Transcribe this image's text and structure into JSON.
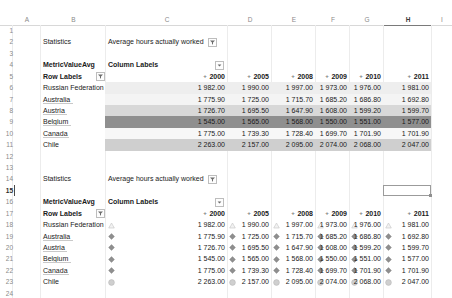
{
  "app": {
    "name": "spreadsheet",
    "active_cell": "H15",
    "active_column": "H",
    "active_row": "15"
  },
  "columns": [
    "A",
    "B",
    "C",
    "D",
    "E",
    "F",
    "G",
    "H",
    "I"
  ],
  "rows": [
    "1",
    "2",
    "3",
    "4",
    "5",
    "6",
    "7",
    "8",
    "9",
    "10",
    "11",
    "12",
    "13",
    "14",
    "15",
    "16",
    "17",
    "18",
    "19",
    "20",
    "21",
    "22",
    "23",
    "24"
  ],
  "icons": {
    "filter": "filter-icon",
    "dropdown": "chevron-down-icon",
    "expand": "+",
    "triangle": "triangle-up-icon",
    "diamond": "diamond-icon",
    "circle": "circle-icon"
  },
  "table1": {
    "row_index": 2,
    "statistics_label": "Statistics",
    "statistics_value": "Average hours actually worked",
    "metric_label": "MetricValueAvg",
    "column_labels": "Column Labels",
    "row_labels": "Row Labels",
    "years": [
      "2000",
      "2005",
      "2008",
      "2009",
      "2010",
      "2011"
    ],
    "rows": [
      {
        "name": "Russian Federation",
        "values": [
          "1 982.00",
          "1 990.00",
          "1 997.00",
          "1 973.00",
          "1 976.00",
          "1 981.00"
        ]
      },
      {
        "name": "Australia",
        "values": [
          "1 775.90",
          "1 725.00",
          "1 715.70",
          "1 685.20",
          "1 686.80",
          "1 692.80"
        ]
      },
      {
        "name": "Austria",
        "values": [
          "1 726.70",
          "1 695.50",
          "1 647.90",
          "1 608.00",
          "1 599.20",
          "1 599.70"
        ]
      },
      {
        "name": "Belgium",
        "values": [
          "1 545.00",
          "1 565.00",
          "1 568.00",
          "1 550.00",
          "1 551.00",
          "1 577.00"
        ]
      },
      {
        "name": "Canada",
        "values": [
          "1 775.00",
          "1 739.30",
          "1 728.40",
          "1 699.70",
          "1 701.90",
          "1 701.90"
        ]
      },
      {
        "name": "Chile",
        "values": [
          "2 263.00",
          "2 157.00",
          "2 095.00",
          "2 074.00",
          "2 068.00",
          "2 047.00"
        ]
      }
    ]
  },
  "table2": {
    "statistics_label": "Statistics",
    "statistics_value": "Average hours actually worked",
    "metric_label": "MetricValueAvg",
    "column_labels": "Column Labels",
    "row_labels": "Row Labels",
    "years": [
      "2000",
      "2005",
      "2008",
      "2009",
      "2010",
      "2011"
    ],
    "rows": [
      {
        "name": "Russian Federation",
        "icon": "triangle",
        "values": [
          "1 982.00",
          "1 990.00",
          "1 997.00",
          "1 973.00",
          "1 976.00",
          "1 981.00"
        ]
      },
      {
        "name": "Australia",
        "icon": "diamond",
        "values": [
          "1 775.90",
          "1 725.00",
          "1 715.70",
          "1 685.20",
          "1 686.80",
          "1 692.80"
        ]
      },
      {
        "name": "Austria",
        "icon": "diamond",
        "values": [
          "1 726.70",
          "1 695.50",
          "1 647.90",
          "1 608.00",
          "1 599.20",
          "1 599.70"
        ]
      },
      {
        "name": "Belgium",
        "icon": "diamond",
        "values": [
          "1 545.00",
          "1 565.00",
          "1 568.00",
          "1 550.00",
          "1 551.00",
          "1 577.00"
        ]
      },
      {
        "name": "Canada",
        "icon": "diamond",
        "values": [
          "1 775.00",
          "1 739.30",
          "1 728.40",
          "1 699.70",
          "1 701.90",
          "1 701.90"
        ]
      },
      {
        "name": "Chile",
        "icon": "circle",
        "values": [
          "2 263.00",
          "2 157.00",
          "2 095.00",
          "2 074.00",
          "2 068.00",
          "2 047.00"
        ]
      }
    ]
  },
  "colors": {
    "scale_light": "#eeeeee",
    "scale_mid": "#cfcfcf",
    "scale_dark": "#8f8f8f",
    "grid": "#ececec",
    "header_text": "#8a8a8a"
  }
}
